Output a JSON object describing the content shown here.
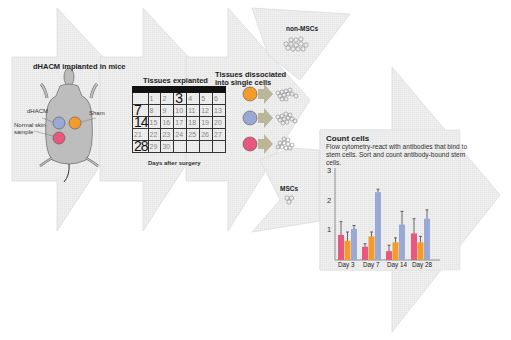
{
  "colors": {
    "arrow_fill": "#efefef",
    "arrow_stroke": "#d6d6d6",
    "pink": "#e8577e",
    "orange": "#f39c2c",
    "blue": "#9aa8d6",
    "mouse": "#bdbdbd",
    "cell_arrow": "#b9b69a"
  },
  "steps": {
    "implant": {
      "title": "dHACM implanted in mice",
      "labels": {
        "dhacm": "dHACM",
        "sham": "Sham",
        "normal_skin": "Normal skin sample"
      }
    },
    "explant": {
      "title": "Tissues explanted",
      "caption": "Days after surgery",
      "calendar": [
        [
          "",
          "1",
          "2",
          "3",
          "4",
          "5",
          "6"
        ],
        [
          "7",
          "8",
          "9",
          "10",
          "11",
          "12",
          "13"
        ],
        [
          "14",
          "15",
          "16",
          "17",
          "18",
          "19",
          "20"
        ],
        [
          "21",
          "22",
          "23",
          "24",
          "25",
          "26",
          "27"
        ],
        [
          "28",
          "29",
          "30",
          "",
          "",
          "",
          ""
        ]
      ],
      "highlight_days": [
        "3",
        "7",
        "14",
        "28"
      ]
    },
    "dissociate": {
      "title_line1": "Tissues dissociated",
      "title_line2": "into single cells"
    },
    "non_msc": {
      "label": "non-MSCs"
    },
    "msc": {
      "label": "MSCs"
    },
    "count": {
      "title": "Count cells",
      "description": "Flow cytometry-react with antibodies that bind to stem cells. Sort and count antibody-bound stem cells."
    }
  },
  "chart_data": {
    "type": "bar",
    "title": "Count cells",
    "xlabel": "",
    "ylabel": "",
    "categories": [
      "Day 3",
      "Day 7",
      "Day 14",
      "Day 28"
    ],
    "yticks": [
      "1",
      "2",
      "3"
    ],
    "ylim": [
      0,
      3
    ],
    "grid": false,
    "series": [
      {
        "name": "Normal skin",
        "color": "#e8577e",
        "values": [
          0.85,
          0.45,
          0.3,
          0.9
        ],
        "errors": [
          0.45,
          0.1,
          0.2,
          0.5
        ]
      },
      {
        "name": "Sham",
        "color": "#f39c2c",
        "values": [
          0.65,
          0.8,
          0.6,
          0.6
        ],
        "errors": [
          0.3,
          0.15,
          0.15,
          0.2
        ]
      },
      {
        "name": "dHACM",
        "color": "#9aa8d6",
        "values": [
          1.05,
          2.3,
          1.2,
          1.4
        ],
        "errors": [
          0.12,
          0.1,
          0.45,
          0.3
        ]
      }
    ]
  }
}
